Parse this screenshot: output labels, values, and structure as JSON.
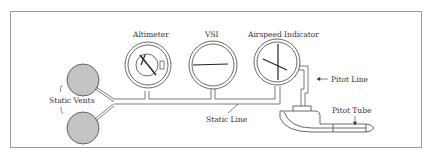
{
  "diagram": {
    "labels": {
      "altimeter": "Altimeter",
      "vsi": "VSI",
      "airspeed": "Airspeed Indicator",
      "static_vents": "Static Vents",
      "static_line": "Static Line",
      "pitot_line": "Pitot Line",
      "pitot_tube": "Pitot Tube"
    },
    "colors": {
      "vent_fill": "#c4c4c4",
      "line": "#444444",
      "frame": "#9a9a9a"
    }
  }
}
